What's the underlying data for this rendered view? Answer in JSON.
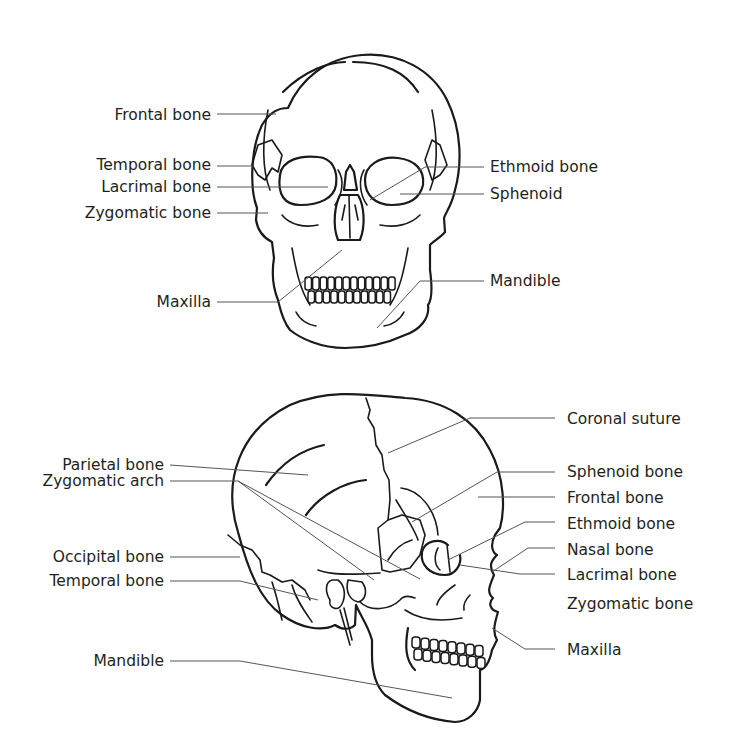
{
  "figure": {
    "type": "skull-anatomy-diagram",
    "views": [
      "anterior",
      "lateral"
    ]
  },
  "front_view": {
    "labels_left": [
      "Frontal bone",
      "Temporal bone",
      "Lacrimal bone",
      "Zygomatic bone",
      "Maxilla"
    ],
    "labels_right": [
      "Ethmoid bone",
      "Sphenoid",
      "Mandible"
    ]
  },
  "side_view": {
    "labels_left": [
      "Parietal bone",
      "Zygomatic arch",
      "Occipital bone",
      "Temporal bone",
      "Mandible"
    ],
    "labels_right": [
      "Coronal suture",
      "Sphenoid bone",
      "Frontal bone",
      "Ethmoid bone",
      "Nasal bone",
      "Lacrimal bone",
      "Zygomatic bone",
      "Maxilla"
    ]
  }
}
